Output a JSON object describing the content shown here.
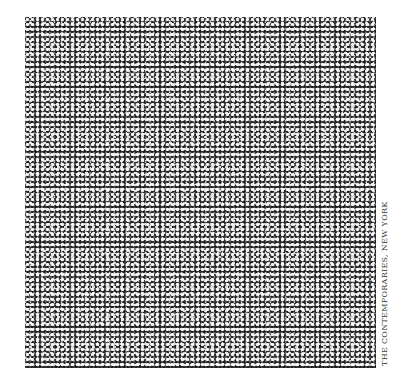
{
  "artwork": {
    "description": "Square grayscale artwork with dense quasi-periodic pattern of small white dots and rosettes",
    "colors": {
      "background": "#ffffff",
      "pattern_base": "#6e6e6e",
      "dot": "#ffffff",
      "dark": "#1e1e1e"
    }
  },
  "caption": {
    "text": "THE CONTEMPORARIES, NEW YORK"
  }
}
